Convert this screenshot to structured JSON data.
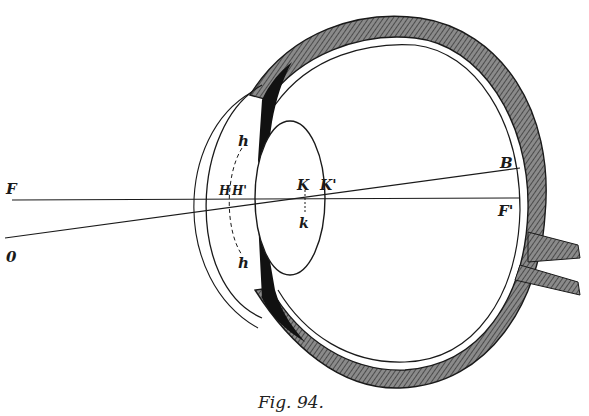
{
  "figure": {
    "caption": "Fig. 94.",
    "labels": {
      "F": "F",
      "O": "0",
      "H": "H",
      "H_prime": "H'",
      "h_top": "h",
      "h_bottom": "h",
      "K": "K",
      "K_prime": "K'",
      "k": "k",
      "B": "B",
      "F_prime": "F'"
    }
  }
}
